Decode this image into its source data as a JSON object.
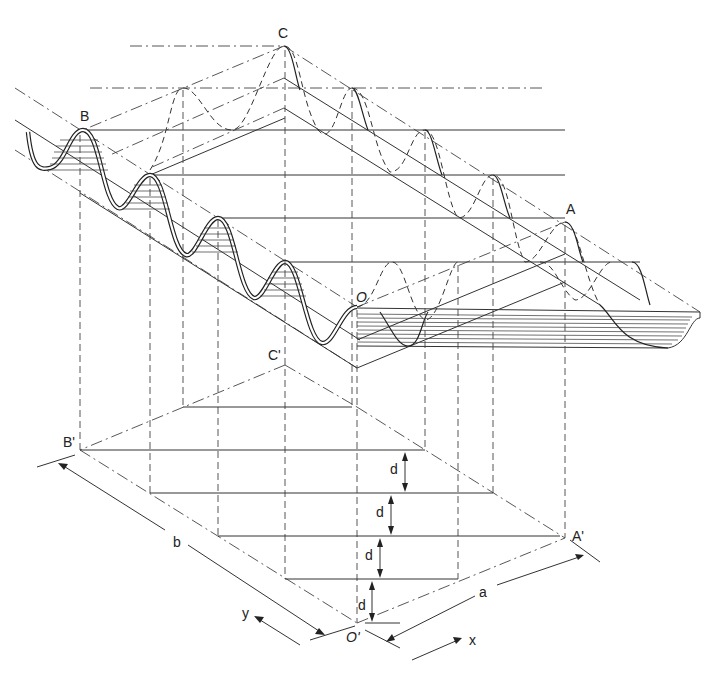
{
  "figure": {
    "labels": {
      "C": "C",
      "B": "B",
      "A": "A",
      "O": "O",
      "C_prime": "C'",
      "B_prime": "B'",
      "A_prime": "A'",
      "O_prime": "O'"
    },
    "dimensions": {
      "a": "a",
      "b": "b",
      "d": [
        "d",
        "d",
        "d",
        "d"
      ]
    },
    "axes": {
      "x": "x",
      "y": "y"
    },
    "colors": {
      "background": "#ffffff",
      "ink": "#222222"
    }
  }
}
